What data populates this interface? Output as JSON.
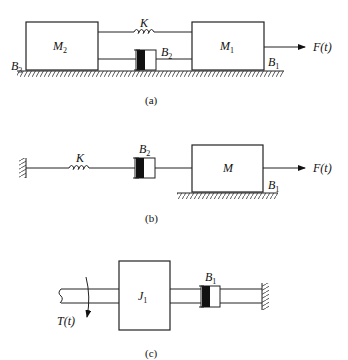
{
  "figure": {
    "panels": [
      {
        "id": "a",
        "caption": "(a)",
        "elements": {
          "mass_left": {
            "label": "M",
            "sub": "2"
          },
          "mass_right": {
            "label": "M",
            "sub": "1"
          },
          "spring": {
            "label": "K"
          },
          "damper": {
            "label": "B",
            "sub": "2"
          },
          "friction_left": {
            "label": "B",
            "sub": "3"
          },
          "friction_right": {
            "label": "B",
            "sub": "1"
          },
          "force": {
            "label": "F(t)"
          }
        }
      },
      {
        "id": "b",
        "caption": "(b)",
        "elements": {
          "spring": {
            "label": "K"
          },
          "damper": {
            "label": "B",
            "sub": "2"
          },
          "mass": {
            "label": "M"
          },
          "friction": {
            "label": "B",
            "sub": "1"
          },
          "force": {
            "label": "F(t)"
          }
        }
      },
      {
        "id": "c",
        "caption": "(c)",
        "elements": {
          "inertia": {
            "label": "J",
            "sub": "1"
          },
          "damper": {
            "label": "B",
            "sub": "1"
          },
          "torque": {
            "label": "T(t)"
          }
        }
      }
    ]
  }
}
